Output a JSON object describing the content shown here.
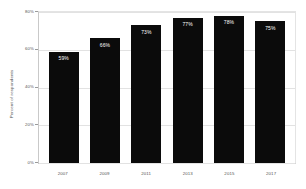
{
  "chart_data": {
    "type": "bar",
    "title": "",
    "xlabel": "",
    "ylabel": "Percent of respondents",
    "categories": [
      "2007",
      "2009",
      "2011",
      "2013",
      "2015",
      "2017"
    ],
    "values": [
      59,
      66,
      73,
      77,
      78,
      75
    ],
    "data_labels": [
      "59%",
      "66%",
      "73%",
      "77%",
      "78%",
      "75%"
    ],
    "ylim": [
      0,
      80
    ],
    "y_ticks": [
      80,
      60,
      40,
      20,
      0
    ],
    "y_tick_labels": [
      "80%",
      "60%",
      "40%",
      "20%",
      "0%"
    ],
    "grid": true,
    "legend": "none",
    "bar_color": "#0b0b0b",
    "grid_color": "#e2e2e2",
    "axis_color": "#c9c9c9",
    "label_color": "#555555",
    "data_label_color": "#ffffff"
  }
}
